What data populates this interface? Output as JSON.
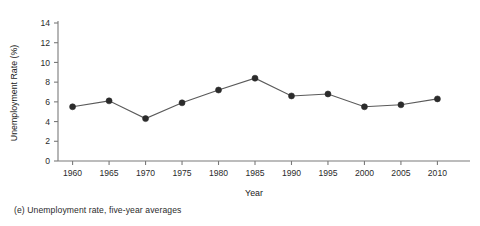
{
  "caption": "(e) Unemployment rate, five-year averages",
  "chart_data": {
    "type": "line",
    "title": "",
    "xlabel": "Year",
    "ylabel": "Unemployment Rate (%)",
    "categories": [
      1960,
      1965,
      1970,
      1975,
      1980,
      1985,
      1990,
      1995,
      2000,
      2005,
      2010
    ],
    "x_tick_labels": [
      "1960",
      "1965",
      "1970",
      "1975",
      "1980",
      "1985",
      "1990",
      "1995",
      "2000",
      "2005",
      "2010"
    ],
    "values": [
      5.5,
      6.1,
      4.3,
      5.9,
      7.2,
      8.4,
      6.6,
      6.8,
      5.5,
      5.7,
      6.3
    ],
    "y_ticks": [
      0,
      2,
      4,
      6,
      8,
      10,
      12,
      14
    ],
    "y_tick_labels": [
      "0",
      "2",
      "4",
      "6",
      "8",
      "10",
      "12",
      "14"
    ],
    "ylim": [
      0,
      14
    ],
    "xlim": [
      1958,
      2012
    ],
    "grid": false,
    "legend": null,
    "marker": "filled-circle",
    "line_color": "#5a5a5a",
    "marker_color": "#2b2b2b",
    "axis_color": "#7a7a7a"
  }
}
